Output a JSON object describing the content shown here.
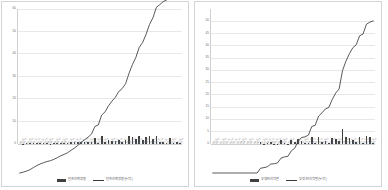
{
  "chart_data": [
    {
      "type": "bar",
      "title": "",
      "xlabel": "",
      "ylabel": "",
      "ylim": [
        0,
        60
      ],
      "yticks": [
        0,
        10,
        20,
        30,
        40,
        50,
        60
      ],
      "grid": true,
      "legend_position": "bottom",
      "categories": [
        "'00.上",
        "'00.下",
        "'01.上",
        "'01.下",
        "'02.上",
        "'02.下",
        "'03.上",
        "'03.下",
        "'04.上",
        "'04.下",
        "'05.上",
        "'05.下",
        "'06.上",
        "'06.下",
        "'07.上",
        "'07.下",
        "'08.上",
        "'08.下",
        "'09.上",
        "'09.下",
        "'10.上",
        "'10.下",
        "'11.上",
        "'11.下",
        "'12.上",
        "'12.下",
        "'13.上",
        "'13.下",
        "'14.上",
        "'14.下",
        "'15.上",
        "'15.下",
        "'16.上",
        "'16.下",
        "'17.上",
        "'17.下",
        "'18.上",
        "'18.下",
        "'19.上",
        "'19.下",
        "'20.上",
        "'20.下",
        "'21.上",
        "'21.下",
        "'22.上",
        "'22.下",
        "'23.上",
        "'23.下"
      ],
      "series": [
        {
          "name": "인프라확정량",
          "kind": "bar",
          "values": [
            0.0,
            0.2,
            0.3,
            0.4,
            0.6,
            0.6,
            0.5,
            0.4,
            0.3,
            0.2,
            0.4,
            0.5,
            0.6,
            0.4,
            0.5,
            0.8,
            0.7,
            0.9,
            1.0,
            0.9,
            0.8,
            1.0,
            2.6,
            0.5,
            3.4,
            1.0,
            2.0,
            1.5,
            1.2,
            1.9,
            0.9,
            1.6,
            3.6,
            3.0,
            2.4,
            3.5,
            1.6,
            2.9,
            3.4,
            2.3,
            3.6,
            0.9,
            1.0,
            0.5,
            2.8,
            0.4,
            0.9,
            0.5
          ]
        },
        {
          "name": "인프라확정량(누적)",
          "kind": "line",
          "values": [
            0.0,
            0.3,
            0.7,
            1.2,
            2.0,
            2.7,
            3.3,
            3.8,
            4.2,
            4.5,
            5.0,
            5.6,
            6.3,
            6.8,
            7.4,
            8.3,
            9.1,
            10.1,
            11.2,
            12.2,
            13.1,
            14.2,
            17.0,
            17.6,
            21.2,
            22.4,
            24.6,
            26.3,
            27.7,
            29.8,
            30.9,
            32.7,
            36.5,
            39.7,
            42.3,
            46.0,
            47.8,
            50.8,
            54.4,
            56.8,
            60.6,
            61.6,
            62.7,
            63.3,
            66.2,
            66.7,
            67.7,
            68.3
          ]
        }
      ]
    },
    {
      "type": "bar",
      "title": "",
      "xlabel": "",
      "ylabel": "",
      "ylim": [
        0,
        55
      ],
      "yticks": [
        0,
        5,
        10,
        15,
        20,
        25,
        30,
        35,
        40,
        45,
        50
      ],
      "grid": true,
      "legend_position": "bottom",
      "categories": [
        "'00.上",
        "'00.下",
        "'01.上",
        "'01.下",
        "'02.上",
        "'02.下",
        "'03.上",
        "'03.下",
        "'04.上",
        "'04.下",
        "'05.上",
        "'05.下",
        "'06.上",
        "'06.下",
        "'07.上",
        "'07.下",
        "'08.上",
        "'08.下",
        "'09.上",
        "'09.下",
        "'10.上",
        "'10.下",
        "'11.上",
        "'11.下",
        "'12.上",
        "'12.下",
        "'13.上",
        "'13.下",
        "'14.上",
        "'14.下",
        "'15.上",
        "'15.下",
        "'16.上",
        "'16.下",
        "'17.上",
        "'17.下",
        "'18.上",
        "'18.下",
        "'19.上",
        "'19.下",
        "'20.上",
        "'20.下",
        "'21.上",
        "'21.下",
        "'22.上",
        "'22.下",
        "'23.上",
        "'23.下"
      ],
      "series": [
        {
          "name": "부정/비리적발",
          "kind": "bar",
          "values": [
            0.0,
            0.0,
            0.0,
            0.0,
            0.0,
            0.0,
            0.0,
            0.0,
            0.0,
            0.0,
            0.0,
            0.0,
            0.0,
            0.0,
            0.8,
            0.2,
            0.3,
            1.0,
            0.1,
            0.2,
            1.5,
            0.4,
            0.2,
            1.6,
            0.9,
            2.2,
            1.4,
            0.3,
            0.6,
            2.8,
            0.4,
            3.0,
            1.0,
            1.2,
            0.5,
            2.6,
            2.0,
            1.3,
            6.0,
            3.0,
            2.4,
            1.8,
            1.0,
            2.8,
            0.6,
            3.2,
            3.0,
            0.4
          ]
        },
        {
          "name": "부정/비리적발(누적)",
          "kind": "line",
          "values": [
            0.0,
            0.0,
            0.0,
            0.0,
            0.0,
            0.0,
            0.0,
            0.0,
            0.0,
            0.0,
            0.0,
            0.0,
            0.0,
            0.0,
            1.6,
            1.8,
            2.1,
            3.0,
            3.1,
            3.4,
            5.0,
            5.4,
            5.6,
            7.4,
            8.3,
            10.6,
            11.9,
            12.1,
            12.7,
            15.6,
            16.0,
            19.1,
            20.2,
            21.5,
            22.0,
            24.7,
            26.8,
            28.2,
            34.4,
            37.5,
            40.0,
            42.0,
            43.0,
            46.0,
            46.6,
            49.9,
            50.6,
            51.0
          ]
        }
      ]
    }
  ]
}
